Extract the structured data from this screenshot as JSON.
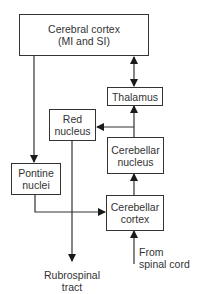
{
  "diagram": {
    "nodes": [
      {
        "id": "cerebral-cortex",
        "lines": [
          "Cerebral cortex",
          "(MI and SI)"
        ]
      },
      {
        "id": "thalamus",
        "lines": [
          "Thalamus"
        ]
      },
      {
        "id": "red-nucleus",
        "lines": [
          "Red",
          "nucleus"
        ]
      },
      {
        "id": "cerebellar-nucleus",
        "lines": [
          "Cerebellar",
          "nucleus"
        ]
      },
      {
        "id": "pontine-nuclei",
        "lines": [
          "Pontine",
          "nuclei"
        ]
      },
      {
        "id": "cerebellar-cortex",
        "lines": [
          "Cerebellar",
          "cortex"
        ]
      }
    ],
    "labels": {
      "rubrospinal": [
        "Rubrospinal",
        "tract"
      ],
      "spinal_input": [
        "From",
        "spinal cord"
      ]
    },
    "edges": [
      {
        "from": "cerebral-cortex",
        "to": "thalamus",
        "bidirectional": true
      },
      {
        "from": "cerebral-cortex",
        "to": "pontine-nuclei"
      },
      {
        "from": "pontine-nuclei",
        "to": "cerebellar-cortex"
      },
      {
        "from": "cerebellar-cortex",
        "to": "cerebellar-nucleus"
      },
      {
        "from": "cerebellar-nucleus",
        "to": "thalamus"
      },
      {
        "from": "cerebellar-nucleus",
        "to": "red-nucleus"
      },
      {
        "from": "red-nucleus",
        "to": "rubrospinal-tract"
      },
      {
        "from": "spinal-cord",
        "to": "cerebellar-cortex"
      }
    ]
  }
}
